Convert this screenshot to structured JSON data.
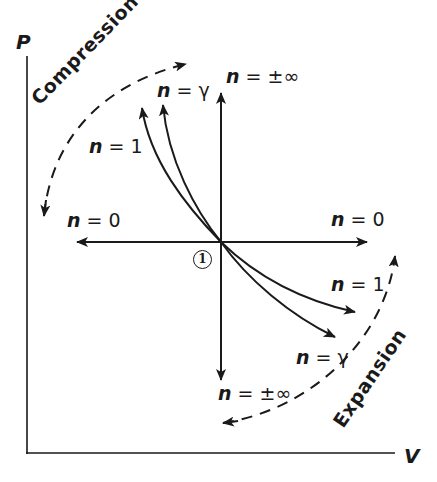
{
  "diagram": {
    "axes": {
      "y_label": "P",
      "x_label": "V"
    },
    "state_point": "1",
    "processes": [
      {
        "id": "isobaric_left",
        "label_var": "n",
        "label_rel": "= 0"
      },
      {
        "id": "isobaric_right",
        "label_var": "n",
        "label_rel": "= 0"
      },
      {
        "id": "isochoric_up",
        "label_var": "n",
        "label_rel": "= ±∞"
      },
      {
        "id": "isochoric_down",
        "label_var": "n",
        "label_rel": "= ±∞"
      },
      {
        "id": "isothermal_up",
        "label_var": "n",
        "label_rel": "= 1"
      },
      {
        "id": "isothermal_down",
        "label_var": "n",
        "label_rel": "= 1"
      },
      {
        "id": "isentropic_up",
        "label_var": "n",
        "label_rel": "= γ"
      },
      {
        "id": "isentropic_down",
        "label_var": "n",
        "label_rel": "= γ"
      }
    ],
    "regions": {
      "compression": "Compression",
      "expansion": "Expansion"
    },
    "colors": {
      "ink": "#1a1a1a",
      "background": "#ffffff"
    }
  }
}
